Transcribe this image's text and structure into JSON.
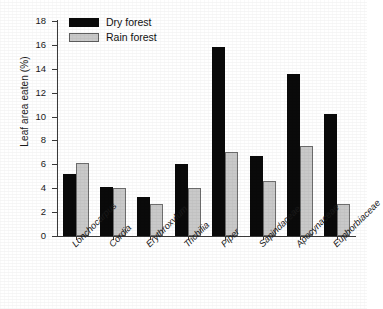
{
  "chart_data": {
    "type": "bar",
    "title": "",
    "xlabel": "",
    "ylabel": "Leaf area eaten (%)",
    "ylim": [
      0,
      18
    ],
    "ytick_step": 2,
    "yticks": [
      "0",
      "2",
      "4",
      "6",
      "8",
      "10",
      "12",
      "14",
      "16",
      "18"
    ],
    "grid": false,
    "legend_position": "upper-left-inside",
    "categories": [
      "Lonchocarpus",
      "Cordia",
      "Erythroxylum",
      "Trichilia",
      "Piper",
      "Sapindaceae",
      "Apocynaceae",
      "Euphorbiaceae"
    ],
    "series": [
      {
        "name": "Dry forest",
        "color": "#0a0a0a",
        "values": [
          5.2,
          4.1,
          3.3,
          6.0,
          15.8,
          6.7,
          13.6,
          10.2
        ]
      },
      {
        "name": "Rain forest",
        "color": "#c9c9c9",
        "values": [
          6.1,
          4.0,
          2.7,
          4.0,
          7.0,
          4.6,
          7.5,
          2.7
        ]
      }
    ]
  },
  "legend": {
    "items": [
      {
        "label": "Dry forest",
        "swatch": "dry"
      },
      {
        "label": "Rain forest",
        "swatch": "rain"
      }
    ]
  },
  "colors": {
    "dry_forest": "#0a0a0a",
    "rain_forest": "#c9c9c9",
    "rain_forest_outline": "#6e6e6e",
    "axis": "#3a3a3a",
    "background": "#ffffff"
  }
}
